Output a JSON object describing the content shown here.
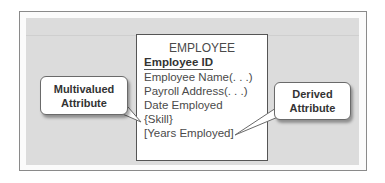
{
  "entity": {
    "name": "EMPLOYEE",
    "identifier": "Employee ID",
    "attributes": [
      "Employee Name(. . .)",
      "Payroll Address(. . .)",
      "Date Employed",
      "{Skill}",
      "[Years Employed]"
    ]
  },
  "callouts": {
    "multivalued": {
      "line1": "Multivalued",
      "line2": "Attribute",
      "points_to": "{Skill}"
    },
    "derived": {
      "line1": "Derived",
      "line2": "Attribute",
      "points_to": "[Years Employed]"
    }
  },
  "colors": {
    "panel": "#dcdcdc",
    "text": "#4a4a4a",
    "border": "#555555"
  }
}
